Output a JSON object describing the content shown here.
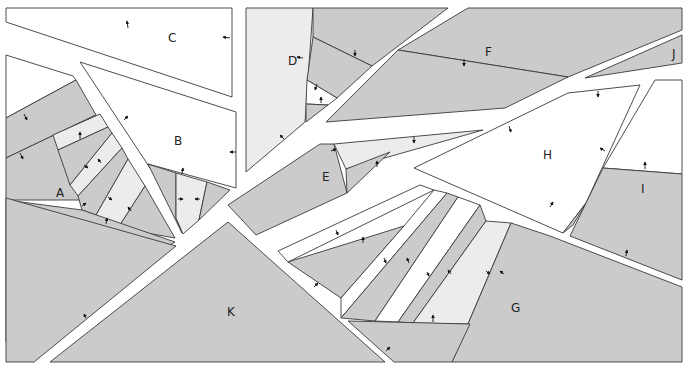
{
  "diagram": {
    "type": "paper-piecing-pattern",
    "colors": {
      "dark": "#cbcbcb",
      "light": "#ececec",
      "white": "#ffffff",
      "line": "#3a3a3a"
    },
    "sections": [
      {
        "id": "A",
        "label": "A"
      },
      {
        "id": "B",
        "label": "B"
      },
      {
        "id": "C",
        "label": "C"
      },
      {
        "id": "D",
        "label": "D"
      },
      {
        "id": "E",
        "label": "E"
      },
      {
        "id": "F",
        "label": "F"
      },
      {
        "id": "G",
        "label": "G"
      },
      {
        "id": "H",
        "label": "H"
      },
      {
        "id": "I",
        "label": "I"
      },
      {
        "id": "J",
        "label": "J"
      },
      {
        "id": "K",
        "label": "K"
      }
    ]
  }
}
